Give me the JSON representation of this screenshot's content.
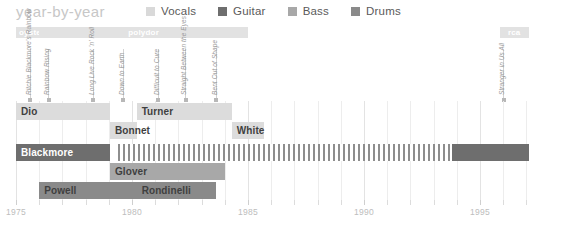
{
  "header": {
    "title": "year-by-year",
    "legend": [
      {
        "label": "Vocals",
        "color": "#d9d9d9",
        "icon": "square-swatch"
      },
      {
        "label": "Guitar",
        "color": "#6e6e6e",
        "icon": "square-swatch"
      },
      {
        "label": "Bass",
        "color": "#a8a8a8",
        "icon": "square-swatch"
      },
      {
        "label": "Drums",
        "color": "#8a8a8a",
        "icon": "square-swatch"
      }
    ]
  },
  "record_labels": [
    {
      "name": "oyster",
      "start": 1975.0,
      "end": 1976.0
    },
    {
      "name": "polydor",
      "start": 1976.0,
      "end": 1985.0
    },
    {
      "name": "rca",
      "start": 1995.85,
      "end": 1997.1
    }
  ],
  "albums": [
    {
      "title": "Ritchie Blackmore's Rainbow",
      "year": 1975.6
    },
    {
      "title": "Rainbow Rising",
      "year": 1976.4
    },
    {
      "title": "Long Live Rock 'n' Roll",
      "year": 1978.3
    },
    {
      "title": "Down to Earth",
      "year": 1979.6
    },
    {
      "title": "Difficult to Cure",
      "year": 1981.1
    },
    {
      "title": "Straight Between the Eyes",
      "year": 1982.3
    },
    {
      "title": "Bent Out of Shape",
      "year": 1983.6
    },
    {
      "title": "Stranger in Us All",
      "year": 1996.0
    }
  ],
  "rows": [
    {
      "role": "Vocals",
      "color": "#dcdcdc",
      "text_color": "#3f3f3f",
      "segments": [
        {
          "name": "Dio",
          "start": 1975.0,
          "end": 1979.05
        },
        {
          "name": "Turner",
          "start": 1980.2,
          "end": 1984.3
        }
      ]
    },
    {
      "role": "Vocals",
      "color": "#dcdcdc",
      "text_color": "#3f3f3f",
      "segments": [
        {
          "name": "Bonnet",
          "start": 1979.05,
          "end": 1980.2
        },
        {
          "name": "White",
          "start": 1984.3,
          "end": 1985.7
        }
      ]
    },
    {
      "role": "Guitar",
      "color": "#6e6e6e",
      "text_color": "#ffffff",
      "segments": [
        {
          "name": "Blackmore",
          "start": 1975.0,
          "end": 1979.05,
          "style": "solid"
        },
        {
          "name": "",
          "start": 1979.4,
          "end": 1993.8,
          "style": "hatched"
        },
        {
          "name": "",
          "start": 1993.8,
          "end": 1997.1,
          "style": "solid"
        }
      ]
    },
    {
      "role": "Bass",
      "color": "#a8a8a8",
      "text_color": "#3f3f3f",
      "segments": [
        {
          "name": "Glover",
          "start": 1979.05,
          "end": 1984.0
        }
      ]
    },
    {
      "role": "Drums",
      "color": "#8a8a8a",
      "text_color": "#3f3f3f",
      "segments": [
        {
          "name": "Powell",
          "start": 1976.0,
          "end": 1980.2
        },
        {
          "name": "Rondinelli",
          "start": 1980.2,
          "end": 1983.6
        }
      ]
    }
  ],
  "axis": {
    "ticks_labeled": [
      "1975",
      "1980",
      "1985",
      "1990",
      "1995"
    ],
    "tick_years": [
      1975,
      1980,
      1985,
      1990,
      1995
    ],
    "minor_step": 1,
    "range": [
      1975,
      1997
    ]
  },
  "chart_data": {
    "type": "timeline",
    "title": "year-by-year",
    "xlabel": "",
    "ylabel": "",
    "xlim": [
      1975,
      1997
    ],
    "grid": true,
    "legend_position": "top",
    "categories": [
      "Vocals",
      "Guitar",
      "Bass",
      "Drums"
    ],
    "series": [
      {
        "name": "Dio",
        "role": "Vocals",
        "start": 1975.0,
        "end": 1979.05
      },
      {
        "name": "Bonnet",
        "role": "Vocals",
        "start": 1979.05,
        "end": 1980.2
      },
      {
        "name": "Turner",
        "role": "Vocals",
        "start": 1980.2,
        "end": 1984.3
      },
      {
        "name": "White",
        "role": "Vocals",
        "start": 1984.3,
        "end": 1985.7
      },
      {
        "name": "Blackmore",
        "role": "Guitar",
        "start": 1975.0,
        "end": 1997.1
      },
      {
        "name": "Glover",
        "role": "Bass",
        "start": 1979.05,
        "end": 1984.0
      },
      {
        "name": "Powell",
        "role": "Drums",
        "start": 1976.0,
        "end": 1980.2
      },
      {
        "name": "Rondinelli",
        "role": "Drums",
        "start": 1980.2,
        "end": 1983.6
      }
    ],
    "annotations": [
      {
        "text": "oyster",
        "type": "record-label",
        "start": 1975.0,
        "end": 1976.0
      },
      {
        "text": "polydor",
        "type": "record-label",
        "start": 1976.0,
        "end": 1985.0
      },
      {
        "text": "rca",
        "type": "record-label",
        "start": 1995.85,
        "end": 1997.1
      }
    ]
  }
}
